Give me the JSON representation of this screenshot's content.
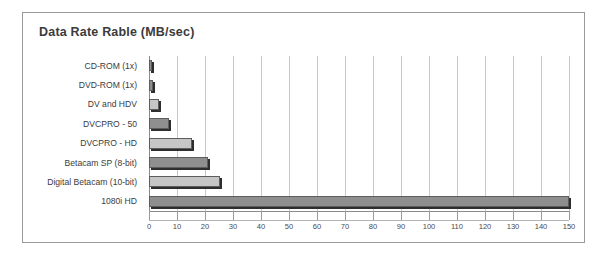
{
  "panel": {
    "title": "Data Rate Rable (MB/sec)"
  },
  "chart_data": {
    "type": "bar",
    "orientation": "horizontal",
    "title": "Data Rate Rable (MB/sec)",
    "xlabel": "",
    "ylabel": "",
    "xlim": [
      0,
      150
    ],
    "xticks": [
      0,
      10,
      20,
      30,
      40,
      50,
      60,
      70,
      80,
      90,
      100,
      110,
      120,
      130,
      140,
      150
    ],
    "grid": true,
    "legend": "none",
    "categories": [
      "CD-ROM (1x)",
      "DVD-ROM (1x)",
      "DV and HDV",
      "DVCPRO - 50",
      "DVCPRO - HD",
      "Betacam SP (8-bit)",
      "Digital Betacam (10-bit)",
      "1080i HD"
    ],
    "values": [
      1.2,
      1.4,
      3.6,
      7,
      15.5,
      21,
      25.5,
      150
    ],
    "bar_colors": [
      "#8f8f8f",
      "#8f8f8f",
      "#c6c6c6",
      "#8f8f8f",
      "#c6c6c6",
      "#8f8f8f",
      "#c6c6c6",
      "#8f8f8f"
    ],
    "colors": {
      "bar_dark": "#8f8f8f",
      "bar_light": "#c6c6c6",
      "bar_outline": "#5d5d5d",
      "bar_shadow": "#2e2e2e",
      "gridline": "#c9c9c9",
      "axis": "#8a8a8a",
      "panel_border": "#9a9a9a",
      "title_text": "#3b3b3b",
      "label_text": "#3c3c3c",
      "background": "#ffffff"
    }
  }
}
